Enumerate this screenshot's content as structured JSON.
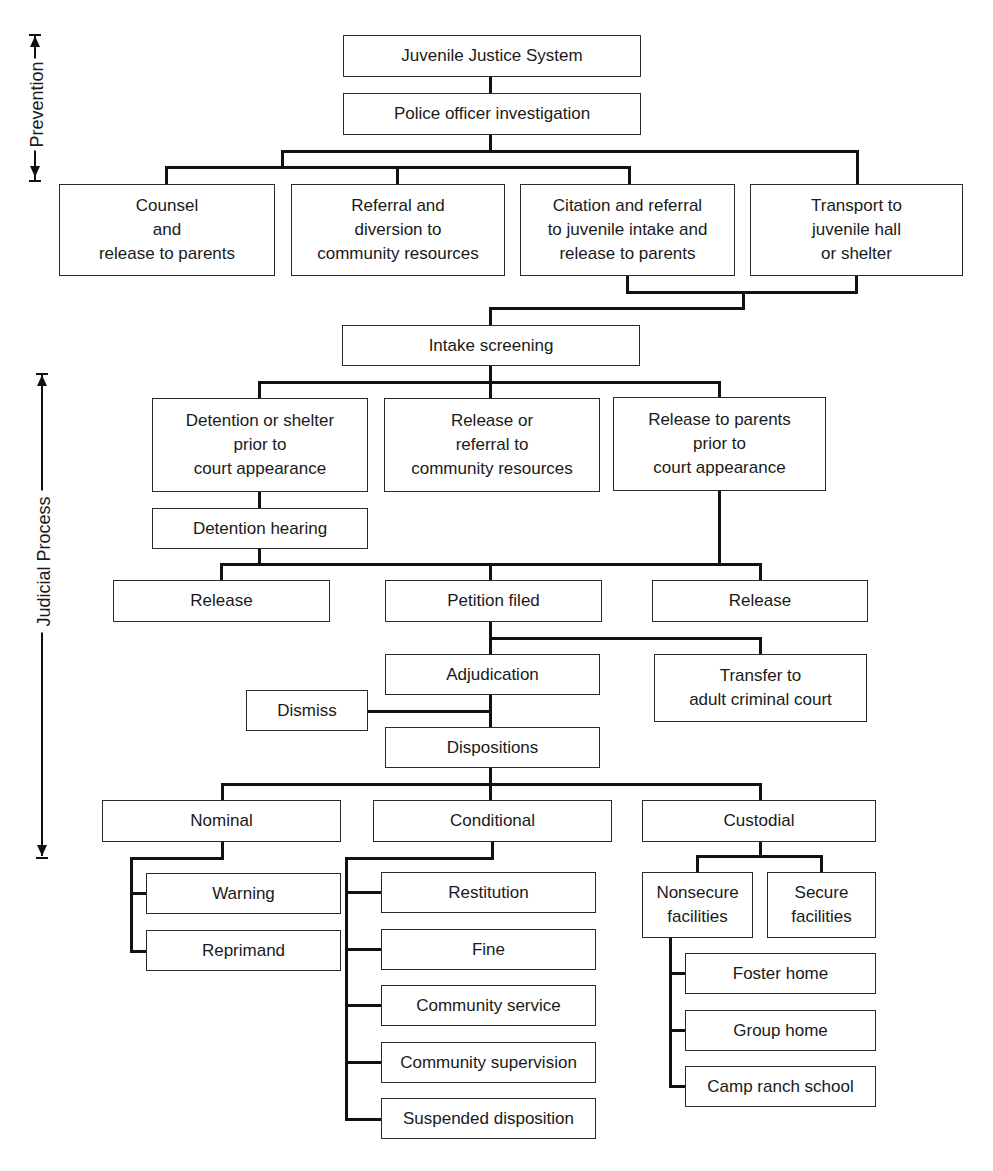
{
  "side_labels": {
    "prevention": "Prevention",
    "judicial": "Judicial Process"
  },
  "nodes": {
    "root": "Juvenile Justice System",
    "police": "Police officer investigation",
    "counsel": "Counsel\nand\nrelease to parents",
    "referral": "Referral and\ndiversion to\ncommunity resources",
    "citation": "Citation and referral\nto juvenile intake and\nrelease to parents",
    "transport": "Transport to\njuvenile hall\nor shelter",
    "intake": "Intake screening",
    "detention": "Detention or shelter\nprior to\ncourt appearance",
    "release_referral": "Release or\nreferral to\ncommunity resources",
    "release_parents": "Release to parents\nprior to\ncourt appearance",
    "detention_hearing": "Detention hearing",
    "release_left": "Release",
    "petition": "Petition filed",
    "release_right": "Release",
    "adjudication": "Adjudication",
    "transfer": "Transfer to\nadult criminal court",
    "dismiss": "Dismiss",
    "dispositions": "Dispositions",
    "nominal": "Nominal",
    "conditional": "Conditional",
    "custodial": "Custodial",
    "warning": "Warning",
    "reprimand": "Reprimand",
    "restitution": "Restitution",
    "fine": "Fine",
    "community_service": "Community service",
    "community_supervision": "Community supervision",
    "suspended": "Suspended disposition",
    "nonsecure": "Nonsecure\nfacilities",
    "secure": "Secure\nfacilities",
    "foster": "Foster home",
    "group": "Group home",
    "camp": "Camp ranch school"
  }
}
